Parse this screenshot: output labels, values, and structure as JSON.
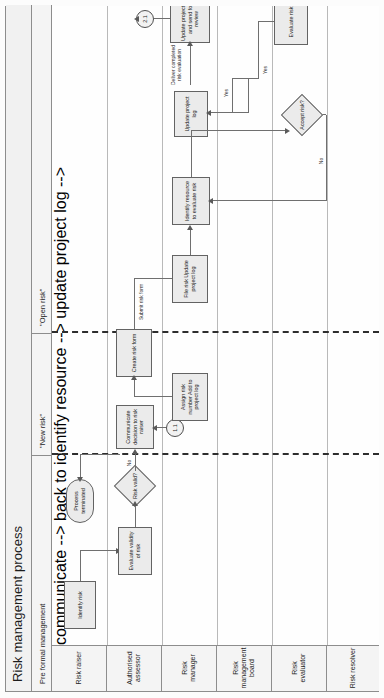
{
  "diagram": {
    "title": "Risk management process",
    "phases": [
      {
        "label": "Pre formal management"
      },
      {
        "label": "\"New risk\""
      },
      {
        "label": "\"Open risk\""
      }
    ],
    "lanes": [
      {
        "label": "Risk raiser"
      },
      {
        "label": "Authorised assessor"
      },
      {
        "label": "Risk manager"
      },
      {
        "label": "Risk management board"
      },
      {
        "label": "Risk evaluator"
      },
      {
        "label": "Risk resolver"
      }
    ],
    "nodes": [
      {
        "id": "identify-risk",
        "label": "Identify risk",
        "shape": "task",
        "lane": "Risk raiser",
        "phase": "Pre formal management"
      },
      {
        "id": "process-terminated",
        "label": "Process terminated",
        "shape": "terminator",
        "lane": "Risk raiser",
        "phase": "Pre formal management"
      },
      {
        "id": "evaluate-validity",
        "label": "Evaluate validity of risk",
        "shape": "task",
        "lane": "Authorised assessor",
        "phase": "Pre formal management"
      },
      {
        "id": "risk-valid",
        "label": "Risk valid?",
        "shape": "decision",
        "lane": "Authorised assessor",
        "phase": "Pre formal management"
      },
      {
        "id": "communicate-decision",
        "label": "Communicate decision to risk raiser",
        "shape": "task",
        "lane": "Authorised assessor",
        "phase": "Pre formal management"
      },
      {
        "id": "create-risk-form",
        "label": "Create risk form",
        "shape": "task",
        "lane": "Authorised assessor",
        "phase": "\"New risk\""
      },
      {
        "id": "assign-risk-number",
        "label": "Assign risk number Add to project log",
        "shape": "task",
        "lane": "Risk manager",
        "phase": "\"New risk\""
      },
      {
        "id": "file-risk-update",
        "label": "File risk Update project log",
        "shape": "task",
        "lane": "Risk manager",
        "phase": "\"New risk\""
      },
      {
        "id": "identify-resource",
        "label": "Identify resource to evaluate risk",
        "shape": "task",
        "lane": "Risk manager",
        "phase": "\"Open risk\""
      },
      {
        "id": "update-project-log",
        "label": "Update project log",
        "shape": "task",
        "lane": "Risk manager",
        "phase": "\"Open risk\""
      },
      {
        "id": "update-log-send-review",
        "label": "Update project log and send for review",
        "shape": "task",
        "lane": "Risk manager",
        "phase": "\"Open risk\""
      },
      {
        "id": "accept-risk",
        "label": "Accept risk?",
        "shape": "decision",
        "lane": "Risk evaluator",
        "phase": "\"Open risk\""
      },
      {
        "id": "evaluate-risk",
        "label": "Evaluate risk",
        "shape": "task",
        "lane": "Risk evaluator",
        "phase": "\"Open risk\""
      }
    ],
    "connectors": [
      {
        "id": "conn-1-1",
        "label": "1.1"
      },
      {
        "id": "conn-2-1",
        "label": "2.1"
      },
      {
        "id": "conn-1-2",
        "label": "1.2"
      }
    ],
    "edge_labels": [
      {
        "id": "edge-no-valid",
        "label": "No"
      },
      {
        "id": "edge-submit-form",
        "label": "Submit risk form"
      },
      {
        "id": "edge-accept-no",
        "label": "No"
      },
      {
        "id": "edge-accept-yes",
        "label": "Yes"
      },
      {
        "id": "edge-eval-yes",
        "label": "Yes"
      },
      {
        "id": "edge-deliver",
        "label": "Deliver completed risk evaluation"
      }
    ]
  }
}
